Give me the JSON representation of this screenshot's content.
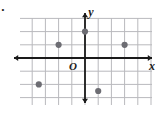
{
  "figure": {
    "kind": "coordinate-plane",
    "origin_label": "O",
    "x_axis_label": "x",
    "y_axis_label": "y",
    "bullet_mark": "·"
  },
  "colors": {
    "grid": "#b9b9bd",
    "axis": "#1a1a1a",
    "point": "#6d6d73",
    "background": "#ffffff",
    "label": "#1a1a1a"
  },
  "chart_data": {
    "type": "scatter",
    "title": "",
    "xlabel": "x",
    "ylabel": "y",
    "grid": true,
    "legend": "none",
    "xlim": [
      -5,
      5
    ],
    "ylim": [
      -3.5,
      3.5
    ],
    "x_tick_step": 1,
    "y_tick_step": 1,
    "tick_labels_shown": false,
    "points": [
      {
        "x": -2,
        "y": 1
      },
      {
        "x": 0,
        "y": 2
      },
      {
        "x": 3,
        "y": 1
      },
      {
        "x": -3.5,
        "y": -2
      },
      {
        "x": 1,
        "y": -2.5
      }
    ]
  },
  "geometry": {
    "origin_px": {
      "x": 85,
      "y": 58
    },
    "unit_px": 13.2,
    "grid_box": {
      "left": 20,
      "top": 18,
      "right": 152,
      "bottom": 105
    },
    "point_radius": 3.1,
    "x_axis_y": 58,
    "y_axis_x": 85,
    "x_axis_from": 14,
    "x_axis_to": 152,
    "y_axis_from": 13,
    "y_axis_to": 103,
    "x_label_pos": {
      "x": 152,
      "y": 70
    },
    "y_label_pos": {
      "x": 91,
      "y": 16
    },
    "origin_label_pos": {
      "x": 73,
      "y": 70
    },
    "bullet_pos": {
      "x": 3,
      "y": 14
    }
  }
}
